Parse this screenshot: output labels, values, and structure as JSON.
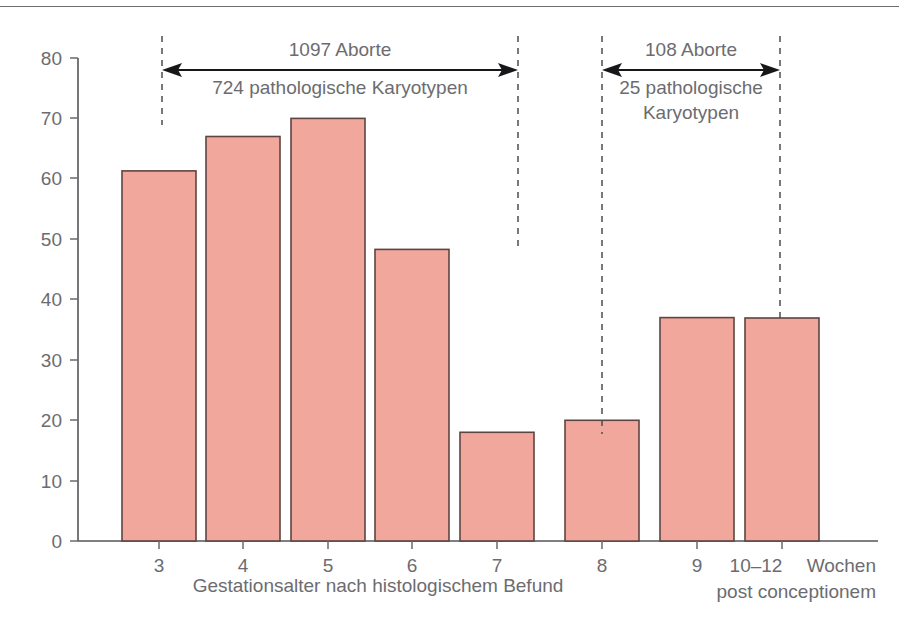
{
  "chart_data": {
    "type": "bar",
    "title": "",
    "xlabel": "Gestationsalter nach histologischem Befund",
    "ylabel": "",
    "categories": [
      "3",
      "4",
      "5",
      "6",
      "7",
      "8",
      "9",
      "10–12"
    ],
    "values": [
      69,
      61.3,
      67,
      70,
      48.3,
      18,
      20,
      37
    ],
    "ylim": [
      0,
      80
    ],
    "yticks": [
      "0",
      "10",
      "20",
      "30",
      "40",
      "50",
      "60",
      "70",
      "80"
    ],
    "grid": false,
    "legend": false,
    "bar_color": "#f2a79d",
    "bar_edge_color": "#5d4541",
    "annotations": [
      {
        "name": "left-span",
        "line_above": "1097 Aborte",
        "line_below": "724 pathologische Karyotypen",
        "covers": [
          "3",
          "4",
          "5",
          "6",
          "7"
        ]
      },
      {
        "name": "right-span",
        "line_above": "108 Aborte",
        "line_below_1": "25 pathologische",
        "line_below_2": "Karyotypen",
        "covers": [
          "8",
          "9",
          "10–12"
        ]
      }
    ],
    "x_right_caption_line1": "Wochen",
    "x_right_caption_line2": "post conceptionem"
  },
  "axis": {
    "y_ticks": [
      "80",
      "70",
      "60",
      "50",
      "40",
      "30",
      "20",
      "10",
      "0"
    ],
    "x_ticks": [
      "3",
      "4",
      "5",
      "6",
      "7",
      "8",
      "9",
      "10–12"
    ],
    "x_title": "Gestationsalter nach histologischem Befund",
    "x_right_line1": "Wochen",
    "x_right_line2": "post conceptionem"
  },
  "annotation_left": {
    "top": "1097 Aborte",
    "bottom": "724 pathologische Karyotypen"
  },
  "annotation_right": {
    "top": "108 Aborte",
    "bottom_line1": "25 pathologische",
    "bottom_line2": "Karyotypen"
  }
}
